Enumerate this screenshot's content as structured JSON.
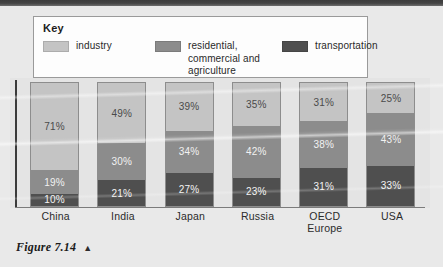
{
  "figure": {
    "caption": "Figure 7.14",
    "caption_marker": "▲"
  },
  "legend": {
    "title": "Key",
    "entries": [
      {
        "label": "industry",
        "swatch_icon": "legend-swatch-industry",
        "color": "#c4c4c4"
      },
      {
        "label": "residential, commercial and agriculture",
        "swatch_icon": "legend-swatch-residential",
        "color": "#8c8c8c"
      },
      {
        "label": "transportation",
        "swatch_icon": "legend-swatch-transportation",
        "color": "#4f4f4f"
      }
    ]
  },
  "chart_data": {
    "type": "bar",
    "subtype": "stacked-100-percent",
    "title": "",
    "subtitle": "",
    "xlabel": "",
    "ylabel": "",
    "ylim": [
      0,
      100
    ],
    "grid": false,
    "legend_position": "top",
    "categories": [
      "China",
      "India",
      "Japan",
      "Russia",
      "OECD Europe",
      "USA"
    ],
    "category_labels_multiline": [
      [
        "China"
      ],
      [
        "India"
      ],
      [
        "Japan"
      ],
      [
        "Russia"
      ],
      [
        "OECD",
        "Europe"
      ],
      [
        "USA"
      ]
    ],
    "series": [
      {
        "name": "industry",
        "color": "#c4c4c4",
        "values": [
          71,
          49,
          39,
          35,
          31,
          25
        ]
      },
      {
        "name": "residential, commercial and agriculture",
        "color": "#8c8c8c",
        "values": [
          19,
          30,
          34,
          42,
          38,
          43
        ]
      },
      {
        "name": "transportation",
        "color": "#4f4f4f",
        "values": [
          10,
          21,
          27,
          23,
          31,
          33
        ]
      }
    ],
    "value_labels": [
      [
        "71%",
        "19%",
        "10%"
      ],
      [
        "49%",
        "30%",
        "21%"
      ],
      [
        "39%",
        "34%",
        "27%"
      ],
      [
        "35%",
        "42%",
        "23%"
      ],
      [
        "31%",
        "38%",
        "31%"
      ],
      [
        "25%",
        "43%",
        "33%"
      ]
    ]
  }
}
